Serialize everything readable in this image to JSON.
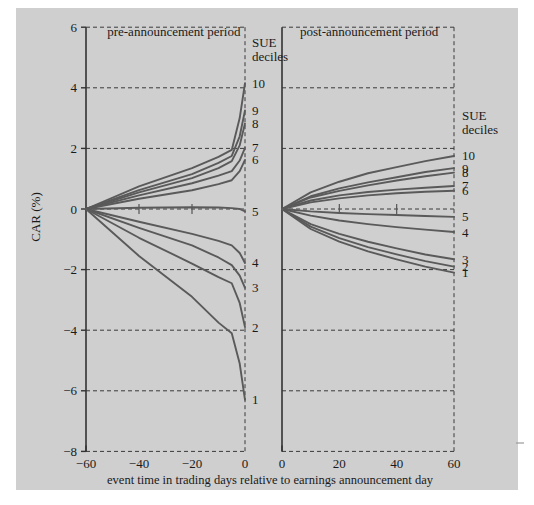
{
  "figure": {
    "background_color": "#cfcfcf",
    "page_color": "#ffffff",
    "line_color": "#5a5a5a",
    "axis_color": "#333333"
  },
  "chart_data": {
    "type": "line",
    "title": "",
    "subtitle": "",
    "xlabel": "event time in trading days relative to earnings announcement day",
    "ylabel": "CAR (%)",
    "ylim": [
      -8,
      6
    ],
    "yticks": [
      -8,
      -6,
      -4,
      -2,
      0,
      2,
      4,
      6
    ],
    "ytick_labels": [
      "−8",
      "−6",
      "−4",
      "−2",
      "0",
      "2",
      "4",
      "6"
    ],
    "grid": true,
    "legend_position": "right",
    "legend_title": "SUE deciles",
    "panels": [
      {
        "key": "pre",
        "title": "pre-announcement period",
        "xlim": [
          -60,
          0
        ],
        "xticks": [
          -60,
          -40,
          -20,
          0
        ],
        "xtick_labels": [
          "−60",
          "−40",
          "−20",
          "0"
        ],
        "legend_title_lines": [
          "SUE",
          "deciles"
        ],
        "series": [
          {
            "name": "10",
            "x": [
              -60,
              -40,
              -20,
              -10,
              -5,
              -2,
              0
            ],
            "y": [
              0.0,
              0.75,
              1.35,
              1.72,
              1.95,
              3.0,
              4.15
            ]
          },
          {
            "name": "9",
            "x": [
              -60,
              -40,
              -20,
              -10,
              -5,
              -2,
              0
            ],
            "y": [
              0.0,
              0.62,
              1.15,
              1.52,
              1.75,
              2.4,
              3.25
            ]
          },
          {
            "name": "8",
            "x": [
              -60,
              -40,
              -20,
              -10,
              -5,
              -2,
              0
            ],
            "y": [
              0.0,
              0.55,
              1.02,
              1.35,
              1.58,
              2.1,
              2.82
            ]
          },
          {
            "name": "7",
            "x": [
              -60,
              -40,
              -20,
              -10,
              -5,
              -2,
              0
            ],
            "y": [
              0.0,
              0.45,
              0.85,
              1.1,
              1.25,
              1.6,
              2.02
            ]
          },
          {
            "name": "6",
            "x": [
              -60,
              -40,
              -20,
              -10,
              -5,
              -2,
              0
            ],
            "y": [
              0.0,
              0.34,
              0.62,
              0.82,
              0.95,
              1.25,
              1.62
            ]
          },
          {
            "name": "5",
            "x": [
              -60,
              -40,
              -20,
              -10,
              -5,
              -2,
              0
            ],
            "y": [
              0.0,
              0.04,
              0.06,
              0.05,
              0.03,
              0.0,
              -0.08
            ]
          },
          {
            "name": "4",
            "x": [
              -60,
              -40,
              -20,
              -10,
              -5,
              -2,
              0
            ],
            "y": [
              0.0,
              -0.42,
              -0.82,
              -1.05,
              -1.2,
              -1.45,
              -1.78
            ]
          },
          {
            "name": "3",
            "x": [
              -60,
              -40,
              -20,
              -10,
              -5,
              -2,
              0
            ],
            "y": [
              0.0,
              -0.62,
              -1.2,
              -1.6,
              -1.85,
              -2.2,
              -2.6
            ]
          },
          {
            "name": "2",
            "x": [
              -60,
              -40,
              -20,
              -10,
              -5,
              -2,
              0
            ],
            "y": [
              0.0,
              -0.95,
              -1.8,
              -2.25,
              -2.45,
              -3.1,
              -3.9
            ]
          },
          {
            "name": "1",
            "x": [
              -60,
              -40,
              -20,
              -10,
              -5,
              -2,
              0
            ],
            "y": [
              0.0,
              -1.55,
              -2.9,
              -3.75,
              -4.1,
              -5.1,
              -6.3
            ]
          }
        ]
      },
      {
        "key": "post",
        "title": "post-announcement period",
        "xlim": [
          0,
          60
        ],
        "xticks": [
          0,
          20,
          40,
          60
        ],
        "xtick_labels": [
          "0",
          "20",
          "40",
          "60"
        ],
        "legend_title_lines": [
          "SUE",
          "deciles"
        ],
        "series": [
          {
            "name": "10",
            "x": [
              0,
              10,
              20,
              30,
              40,
              50,
              60
            ],
            "y": [
              0.0,
              0.55,
              0.9,
              1.18,
              1.38,
              1.58,
              1.75
            ]
          },
          {
            "name": "9",
            "x": [
              0,
              10,
              20,
              30,
              40,
              50,
              60
            ],
            "y": [
              0.0,
              0.42,
              0.68,
              0.88,
              1.05,
              1.22,
              1.35
            ]
          },
          {
            "name": "8",
            "x": [
              0,
              10,
              20,
              30,
              40,
              50,
              60
            ],
            "y": [
              0.0,
              0.38,
              0.6,
              0.78,
              0.94,
              1.08,
              1.2
            ]
          },
          {
            "name": "7",
            "x": [
              0,
              10,
              20,
              30,
              40,
              50,
              60
            ],
            "y": [
              0.0,
              0.28,
              0.45,
              0.56,
              0.64,
              0.7,
              0.76
            ]
          },
          {
            "name": "6",
            "x": [
              0,
              10,
              20,
              30,
              40,
              50,
              60
            ],
            "y": [
              0.0,
              0.22,
              0.35,
              0.45,
              0.52,
              0.57,
              0.6
            ]
          },
          {
            "name": "5",
            "x": [
              0,
              10,
              20,
              30,
              40,
              50,
              60
            ],
            "y": [
              0.0,
              -0.08,
              -0.13,
              -0.17,
              -0.2,
              -0.23,
              -0.26
            ]
          },
          {
            "name": "4",
            "x": [
              0,
              10,
              20,
              30,
              40,
              50,
              60
            ],
            "y": [
              0.0,
              -0.22,
              -0.38,
              -0.5,
              -0.6,
              -0.68,
              -0.76
            ]
          },
          {
            "name": "3",
            "x": [
              0,
              10,
              20,
              30,
              40,
              50,
              60
            ],
            "y": [
              0.0,
              -0.5,
              -0.82,
              -1.08,
              -1.3,
              -1.5,
              -1.66
            ]
          },
          {
            "name": "2",
            "x": [
              0,
              10,
              20,
              30,
              40,
              50,
              60
            ],
            "y": [
              0.0,
              -0.58,
              -0.96,
              -1.26,
              -1.5,
              -1.72,
              -1.9
            ]
          },
          {
            "name": "1",
            "x": [
              0,
              10,
              20,
              30,
              40,
              50,
              60
            ],
            "y": [
              0.0,
              -0.66,
              -1.08,
              -1.4,
              -1.66,
              -1.9,
              -2.1
            ]
          }
        ]
      }
    ],
    "decile_labels_pre": [
      "10",
      "9",
      "8",
      "7",
      "6",
      "5",
      "4",
      "3",
      "2",
      "1"
    ],
    "decile_labels_post": [
      "10",
      "9",
      "8",
      "7",
      "6",
      "5",
      "4",
      "3",
      "2",
      "1"
    ]
  }
}
